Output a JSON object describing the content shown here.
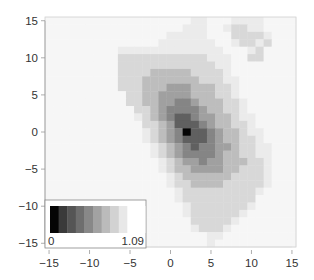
{
  "chart_data": {
    "type": "heatmap",
    "title": "",
    "xlabel": "",
    "ylabel": "",
    "xlim": [
      -15.5,
      15.5
    ],
    "ylim": [
      -15.5,
      15.5
    ],
    "grid": false,
    "x_ticks": [
      -15,
      -10,
      -5,
      0,
      5,
      10,
      15
    ],
    "y_ticks": [
      -15,
      -10,
      -5,
      0,
      5,
      10,
      15
    ],
    "x_tick_labels": [
      "−15",
      "−10",
      "−5",
      "0",
      "5",
      "10",
      "15"
    ],
    "y_tick_labels": [
      "−15",
      "−10",
      "−5",
      "0",
      "5",
      "10",
      "15"
    ],
    "x": [
      -15,
      -14,
      -13,
      -12,
      -11,
      -10,
      -9,
      -8,
      -7,
      -6,
      -5,
      -4,
      -3,
      -2,
      -1,
      0,
      1,
      2,
      3,
      4,
      5,
      6,
      7,
      8,
      9,
      10,
      11,
      12,
      13,
      14,
      15
    ],
    "y": [
      15,
      14,
      13,
      12,
      11,
      10,
      9,
      8,
      7,
      6,
      5,
      4,
      3,
      2,
      1,
      0,
      -1,
      -2,
      -3,
      -4,
      -5,
      -6,
      -7,
      -8,
      -9,
      -10,
      -11,
      -12,
      -13,
      -14,
      -15
    ],
    "color_levels": 9,
    "levels": [
      [
        0,
        0,
        0,
        0,
        0,
        0,
        0,
        0,
        0,
        0,
        0,
        0,
        0,
        0,
        0,
        0,
        0,
        0,
        1,
        1,
        0,
        0,
        0,
        1,
        1,
        1,
        1,
        0,
        0,
        0,
        0
      ],
      [
        0,
        0,
        0,
        0,
        0,
        0,
        0,
        0,
        0,
        0,
        0,
        0,
        0,
        0,
        0,
        0,
        0,
        1,
        1,
        1,
        0,
        0,
        1,
        2,
        2,
        1,
        1,
        0,
        0,
        0,
        0
      ],
      [
        0,
        0,
        0,
        0,
        0,
        0,
        0,
        0,
        0,
        0,
        0,
        0,
        0,
        0,
        0,
        1,
        1,
        1,
        1,
        1,
        0,
        0,
        0,
        2,
        2,
        2,
        2,
        1,
        0,
        0,
        0
      ],
      [
        0,
        0,
        0,
        0,
        0,
        0,
        0,
        0,
        0,
        0,
        0,
        0,
        0,
        0,
        1,
        1,
        1,
        1,
        1,
        1,
        1,
        0,
        0,
        1,
        2,
        2,
        1,
        2,
        0,
        0,
        0
      ],
      [
        0,
        0,
        0,
        0,
        0,
        0,
        0,
        0,
        0,
        1,
        1,
        1,
        1,
        1,
        1,
        1,
        1,
        1,
        1,
        1,
        1,
        1,
        0,
        0,
        0,
        1,
        2,
        0,
        0,
        0,
        0
      ],
      [
        0,
        0,
        0,
        0,
        0,
        0,
        0,
        0,
        0,
        2,
        2,
        2,
        2,
        2,
        2,
        2,
        2,
        2,
        2,
        2,
        1,
        1,
        1,
        0,
        0,
        2,
        2,
        0,
        0,
        0,
        0
      ],
      [
        0,
        0,
        0,
        0,
        0,
        0,
        0,
        0,
        0,
        2,
        2,
        2,
        2,
        2,
        2,
        2,
        2,
        2,
        2,
        2,
        2,
        1,
        1,
        0,
        0,
        0,
        0,
        0,
        0,
        0,
        0
      ],
      [
        0,
        0,
        0,
        0,
        0,
        0,
        0,
        0,
        0,
        2,
        2,
        2,
        2,
        3,
        3,
        3,
        3,
        3,
        2,
        2,
        2,
        2,
        1,
        0,
        0,
        0,
        0,
        0,
        0,
        0,
        0
      ],
      [
        0,
        0,
        0,
        0,
        0,
        0,
        0,
        0,
        0,
        2,
        2,
        2,
        3,
        3,
        3,
        3,
        3,
        3,
        3,
        2,
        2,
        2,
        1,
        1,
        0,
        0,
        0,
        0,
        0,
        0,
        0
      ],
      [
        0,
        0,
        0,
        0,
        0,
        0,
        0,
        0,
        0,
        2,
        2,
        2,
        3,
        3,
        3,
        4,
        4,
        4,
        3,
        3,
        3,
        2,
        2,
        1,
        0,
        0,
        0,
        0,
        0,
        0,
        0
      ],
      [
        0,
        0,
        0,
        0,
        0,
        0,
        0,
        0,
        0,
        0,
        2,
        2,
        3,
        3,
        4,
        4,
        4,
        4,
        3,
        3,
        3,
        2,
        2,
        1,
        0,
        0,
        0,
        0,
        0,
        0,
        0
      ],
      [
        0,
        0,
        0,
        0,
        0,
        0,
        0,
        0,
        0,
        0,
        2,
        2,
        3,
        3,
        4,
        4,
        5,
        5,
        4,
        3,
        3,
        3,
        2,
        2,
        1,
        0,
        0,
        0,
        0,
        0,
        0
      ],
      [
        0,
        0,
        0,
        0,
        0,
        0,
        0,
        0,
        0,
        0,
        0,
        2,
        2,
        3,
        4,
        5,
        5,
        5,
        5,
        4,
        3,
        3,
        2,
        2,
        1,
        0,
        0,
        0,
        0,
        0,
        0
      ],
      [
        0,
        0,
        0,
        0,
        0,
        0,
        0,
        0,
        0,
        0,
        0,
        1,
        2,
        3,
        4,
        5,
        6,
        6,
        5,
        4,
        4,
        3,
        3,
        2,
        1,
        1,
        0,
        0,
        0,
        0,
        0
      ],
      [
        0,
        0,
        0,
        0,
        0,
        0,
        0,
        0,
        0,
        0,
        0,
        0,
        2,
        2,
        3,
        4,
        6,
        6,
        6,
        5,
        4,
        3,
        3,
        2,
        2,
        1,
        0,
        0,
        0,
        0,
        0
      ],
      [
        0,
        0,
        0,
        0,
        0,
        0,
        0,
        0,
        0,
        0,
        0,
        0,
        1,
        2,
        3,
        4,
        5,
        8,
        6,
        6,
        5,
        4,
        3,
        3,
        2,
        1,
        1,
        0,
        0,
        0,
        0
      ],
      [
        0,
        0,
        0,
        0,
        0,
        0,
        0,
        0,
        0,
        0,
        0,
        0,
        1,
        2,
        3,
        4,
        5,
        6,
        6,
        6,
        5,
        4,
        3,
        3,
        2,
        2,
        1,
        0,
        0,
        0,
        0
      ],
      [
        0,
        0,
        0,
        0,
        0,
        0,
        0,
        0,
        0,
        0,
        0,
        0,
        0,
        1,
        2,
        3,
        4,
        5,
        6,
        5,
        5,
        4,
        4,
        3,
        2,
        2,
        1,
        1,
        0,
        0,
        0
      ],
      [
        0,
        0,
        0,
        0,
        0,
        0,
        0,
        0,
        0,
        0,
        0,
        0,
        0,
        1,
        2,
        3,
        4,
        5,
        5,
        5,
        5,
        4,
        3,
        3,
        2,
        2,
        1,
        1,
        0,
        0,
        0
      ],
      [
        0,
        0,
        0,
        0,
        0,
        0,
        0,
        0,
        0,
        0,
        0,
        0,
        0,
        0,
        1,
        2,
        3,
        4,
        4,
        5,
        4,
        4,
        3,
        3,
        3,
        2,
        2,
        1,
        0,
        0,
        0
      ],
      [
        0,
        0,
        0,
        0,
        0,
        0,
        0,
        0,
        0,
        0,
        0,
        0,
        0,
        0,
        1,
        2,
        3,
        3,
        4,
        4,
        4,
        4,
        3,
        3,
        2,
        2,
        2,
        1,
        0,
        0,
        0
      ],
      [
        0,
        0,
        0,
        0,
        0,
        0,
        0,
        0,
        0,
        0,
        0,
        0,
        0,
        0,
        0,
        1,
        2,
        3,
        3,
        3,
        3,
        3,
        3,
        2,
        2,
        2,
        2,
        1,
        0,
        0,
        0
      ],
      [
        0,
        0,
        0,
        0,
        0,
        0,
        0,
        0,
        0,
        0,
        0,
        0,
        0,
        0,
        0,
        1,
        2,
        2,
        3,
        3,
        3,
        3,
        2,
        2,
        2,
        2,
        2,
        1,
        0,
        0,
        0
      ],
      [
        0,
        0,
        0,
        0,
        0,
        0,
        0,
        0,
        0,
        0,
        0,
        0,
        0,
        0,
        0,
        0,
        1,
        2,
        2,
        2,
        2,
        2,
        2,
        2,
        2,
        2,
        1,
        0,
        0,
        0,
        0
      ],
      [
        0,
        0,
        0,
        0,
        0,
        0,
        0,
        0,
        0,
        0,
        0,
        0,
        0,
        0,
        0,
        0,
        1,
        2,
        2,
        2,
        2,
        2,
        2,
        2,
        2,
        2,
        0,
        0,
        0,
        0,
        0
      ],
      [
        0,
        0,
        0,
        0,
        0,
        0,
        0,
        0,
        0,
        0,
        0,
        0,
        0,
        0,
        0,
        0,
        0,
        1,
        2,
        2,
        2,
        2,
        2,
        2,
        2,
        1,
        0,
        0,
        0,
        0,
        0
      ],
      [
        0,
        0,
        0,
        0,
        0,
        0,
        0,
        0,
        0,
        0,
        0,
        0,
        0,
        0,
        0,
        0,
        0,
        1,
        2,
        2,
        2,
        2,
        2,
        2,
        1,
        0,
        0,
        0,
        0,
        0,
        0
      ],
      [
        0,
        0,
        0,
        0,
        0,
        0,
        0,
        0,
        0,
        0,
        0,
        0,
        0,
        0,
        0,
        0,
        0,
        0,
        2,
        2,
        2,
        2,
        2,
        1,
        0,
        0,
        0,
        0,
        0,
        0,
        0
      ],
      [
        0,
        0,
        0,
        0,
        0,
        0,
        0,
        0,
        0,
        0,
        0,
        0,
        0,
        0,
        0,
        0,
        0,
        0,
        1,
        2,
        2,
        2,
        1,
        0,
        0,
        0,
        0,
        0,
        0,
        0,
        0
      ],
      [
        0,
        0,
        0,
        0,
        0,
        0,
        0,
        0,
        0,
        0,
        0,
        0,
        0,
        0,
        0,
        0,
        0,
        0,
        0,
        0,
        1,
        1,
        0,
        0,
        0,
        0,
        0,
        0,
        0,
        0,
        0
      ],
      [
        0,
        0,
        0,
        0,
        0,
        0,
        0,
        0,
        0,
        0,
        0,
        0,
        0,
        0,
        0,
        0,
        0,
        0,
        0,
        0,
        1,
        0,
        0,
        0,
        0,
        0,
        0,
        0,
        0,
        0,
        0
      ]
    ],
    "level_colors": [
      "#f6f6f6",
      "#ebebeb",
      "#d8d8d8",
      "#bdbdbd",
      "#a0a0a0",
      "#858585",
      "#606060",
      "#404040",
      "#050505"
    ],
    "legend": {
      "placement": "bottom-left",
      "min_label": "0",
      "max_label": "1.09",
      "range": [
        0,
        1.09
      ],
      "swatches": [
        "#050505",
        "#3a3a3a",
        "#555555",
        "#6e6e6e",
        "#888888",
        "#a2a2a2",
        "#bbbbbb",
        "#d2d2d2",
        "#e8e8e8",
        "#ffffff"
      ]
    }
  }
}
